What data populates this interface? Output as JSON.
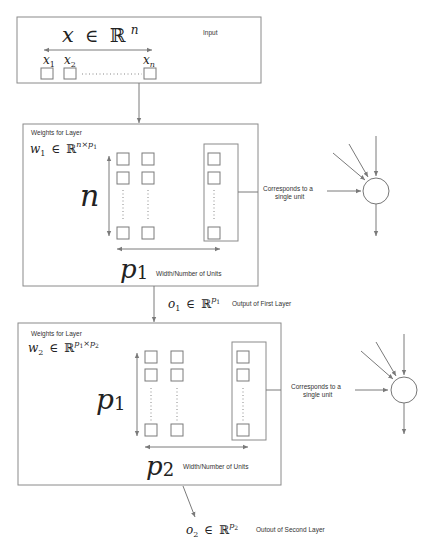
{
  "input": {
    "formula_var": "x",
    "formula_in": "∈",
    "formula_set": "ℝ",
    "formula_exp": "n",
    "label": "Input",
    "elements": [
      {
        "var": "x",
        "sub": "1"
      },
      {
        "var": "x",
        "sub": "2"
      },
      {
        "var": "x",
        "sub": "n"
      }
    ]
  },
  "layer1": {
    "title": "Weights for Layer",
    "w_var": "w",
    "w_sub": "1",
    "w_in": "∈",
    "w_set": "ℝ",
    "w_exp": "n×p",
    "w_exp_sub": "1",
    "rows_label": "n",
    "cols_var": "p",
    "cols_sub": "1",
    "cols_desc": "Width/Number of Units",
    "unit_note_line1": "Corresponds to a",
    "unit_note_line2": "single unit"
  },
  "output1": {
    "var": "o",
    "sub": "1",
    "in": "∈",
    "set": "ℝ",
    "exp": "p",
    "exp_sub": "1",
    "label": "Output of First Layer"
  },
  "layer2": {
    "title": "Weights for Layer",
    "w_var": "w",
    "w_sub": "2",
    "w_in": "∈",
    "w_set": "ℝ",
    "w_exp_a": "p",
    "w_exp_a_sub": "1",
    "w_exp_times": "×",
    "w_exp_b": "p",
    "w_exp_b_sub": "2",
    "rows_var": "p",
    "rows_sub": "1",
    "cols_var": "p",
    "cols_sub": "2",
    "cols_desc": "Width/Number of Units",
    "unit_note_line1": "Corresponds to a",
    "unit_note_line2": "single unit"
  },
  "output2": {
    "var": "o",
    "sub": "2",
    "in": "∈",
    "set": "ℝ",
    "exp": "p",
    "exp_sub": "2",
    "label": "Outout of Second Layer"
  },
  "colors": {
    "stroke": "#7a7a7a",
    "text": "#333333",
    "background": "#ffffff"
  }
}
